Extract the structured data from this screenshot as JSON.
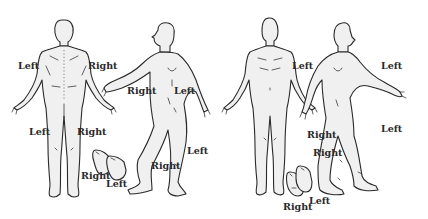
{
  "diagram": {
    "figures": [
      {
        "id": "male-back-view",
        "labels": {
          "upper_left": "Left",
          "upper_right": "Right",
          "lower_left": "Left",
          "lower_right": "Right"
        }
      },
      {
        "id": "male-side-view-right",
        "labels": {
          "arm_right": "Right",
          "torso_left": "Left",
          "leg_right": "Right",
          "leg_left": "Left"
        }
      },
      {
        "id": "feet-back-view",
        "labels": {
          "right": "Right",
          "left": "Left"
        }
      },
      {
        "id": "male-front-view",
        "labels": {
          "upper_left": "Left",
          "lower_right": "Right"
        }
      },
      {
        "id": "male-side-view-left",
        "labels": {
          "arm_left": "Left",
          "leg_left": "Left",
          "leg_right": "Right"
        }
      },
      {
        "id": "feet-front-view",
        "labels": {
          "right": "Right",
          "left": "Left"
        }
      }
    ],
    "colors": {
      "background": "#ffffff",
      "figure_fill": "#f0f0f0",
      "outline": "#2a2a2a",
      "label_text": "#2a2a2a"
    }
  }
}
